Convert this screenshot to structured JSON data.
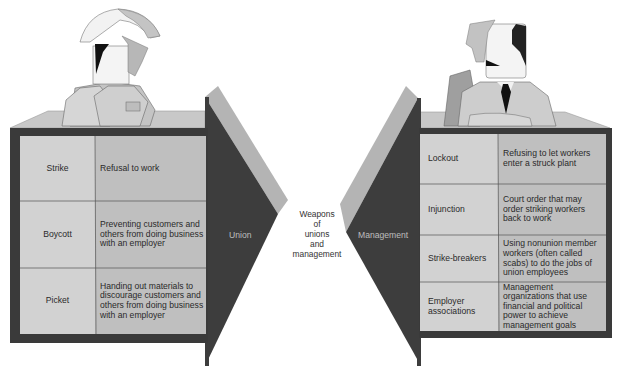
{
  "title": "Weapons of unions and management",
  "center_label": [
    "Weapons",
    "of",
    "unions",
    "and",
    "management"
  ],
  "union": {
    "arrow_label": "Union",
    "rows": [
      {
        "term": "Strike",
        "description": "Refusal to work"
      },
      {
        "term": "Boycott",
        "description": "Preventing customers and others from doing business with an employer"
      },
      {
        "term": "Picket",
        "description": "Handing out materials to discourage customers and others from doing business with an employer"
      }
    ]
  },
  "management": {
    "arrow_label": "Management",
    "rows": [
      {
        "term": "Lockout",
        "description": "Refusing to let workers enter a struck plant"
      },
      {
        "term": "Injunction",
        "description": "Court order that may order striking workers back to work"
      },
      {
        "term": "Strike-breakers",
        "description": "Using nonunion member workers (often called scabs) to do the jobs of union employees"
      },
      {
        "term": "Employer associations",
        "description": "Management organizations that use financial and political power to achieve management goals"
      }
    ]
  },
  "figures": {
    "left": "union worker in hard hat",
    "right": "manager in suit and tie"
  },
  "colors": {
    "frame_dark": "#3a3a3a",
    "cell_light": "#cfcfcf",
    "cell_mid": "#bcbcbc",
    "arrow_face": "#3d3d3d",
    "arrow_edge": "#b4b4b4",
    "desk_top": "#c8c8c8"
  }
}
